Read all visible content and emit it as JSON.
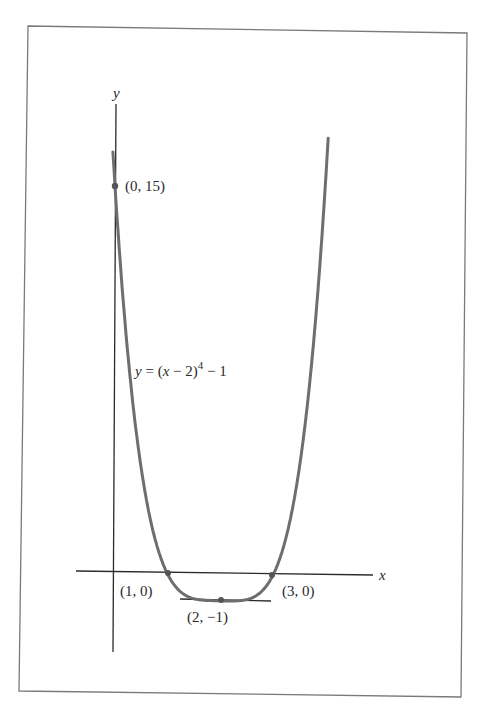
{
  "chart_data": {
    "type": "line",
    "title": "",
    "function_label": "y = (x − 2)^4 − 1",
    "function_label_parts": {
      "lhs": "y",
      "eq": " = (",
      "var": "x",
      "mid": " − 2)",
      "exp": "4",
      "tail": " − 1"
    },
    "xlabel": "x",
    "ylabel": "y",
    "xlim": [
      -0.7,
      5.0
    ],
    "ylim": [
      -2.0,
      17.5
    ],
    "grid": false,
    "legend": "none",
    "series": [
      {
        "name": "y = (x − 2)^4 − 1",
        "x": [
          -0.05,
          0,
          0.25,
          0.5,
          0.75,
          1,
          1.25,
          1.5,
          1.75,
          2,
          2.25,
          2.5,
          2.75,
          3,
          3.25,
          3.5,
          3.75,
          4.0,
          4.15
        ],
        "y": [
          17.1,
          15,
          8.38,
          4.06,
          1.44,
          0,
          -0.68,
          -0.94,
          -1.0,
          -1,
          -1.0,
          -0.94,
          -0.68,
          0,
          1.44,
          4.06,
          8.38,
          15,
          20.4
        ]
      }
    ],
    "annotations": [
      {
        "point": [
          0,
          15
        ],
        "label": "(0, 15)"
      },
      {
        "point": [
          1,
          0
        ],
        "label": "(1, 0)"
      },
      {
        "point": [
          3,
          0
        ],
        "label": "(3, 0)"
      },
      {
        "point": [
          2,
          -1
        ],
        "label": "(2, −1)"
      }
    ],
    "tangent_line": {
      "y": -1,
      "x_from": 1.3,
      "x_to": 2.95
    }
  },
  "labels": {
    "y_axis": "y",
    "x_axis": "x",
    "p015": "(0, 15)",
    "p10": "(1, 0)",
    "p30": "(3, 0)",
    "p2m1": "(2, −1)",
    "fn_lhs": "y",
    "fn_eq": " = (",
    "fn_var": "x",
    "fn_mid": " − 2)",
    "fn_exp": "4",
    "fn_tail": " − 1"
  },
  "colors": {
    "curve": "#6e6e6e",
    "axes": "#2a2a2a",
    "frame": "#7a7a7a",
    "points": "#555555"
  }
}
